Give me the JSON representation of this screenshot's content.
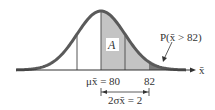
{
  "figure": {
    "area_label": "A",
    "tail_label": "P(x̄ > 82)",
    "axis_label": "x̄",
    "mean_label": "μx̄ = 80",
    "mean_sub": "x̄",
    "value_label": "82",
    "span_label": "2σx̄ = 2",
    "colors": {
      "curve": "#5a5a5a",
      "shade_light": "#c4c4c4",
      "shade_dark": "#7a7a7a",
      "axis": "#333333"
    }
  }
}
